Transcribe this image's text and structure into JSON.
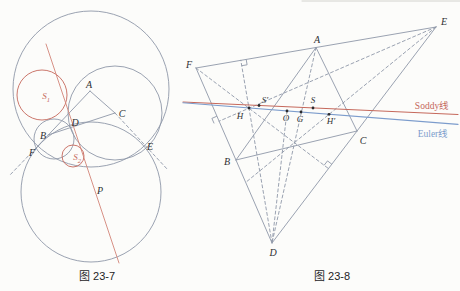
{
  "page": {
    "background": "#fcfcfa"
  },
  "colors": {
    "geometry": "#8f97a8",
    "soddy_red": "#c5685b",
    "soddy_red_light": "#d28478",
    "euler_blue": "#7c9ccc",
    "label": "#2f3033",
    "caption": "#1d1d1f",
    "edge": "#cfcfca"
  },
  "figures": [
    {
      "name": "figure-23-7",
      "caption": {
        "name": "caption-fig-23-7",
        "text": "图 23-7",
        "x": 97,
        "y": 280
      },
      "circles": [
        {
          "name": "outer-circle-top",
          "cx": 91,
          "cy": 89,
          "r": 78,
          "color": "geometry"
        },
        {
          "name": "circle-center-c",
          "cx": 115,
          "cy": 113,
          "r": 47,
          "color": "geometry"
        },
        {
          "name": "circle-center-b",
          "cx": 54,
          "cy": 139,
          "r": 20,
          "color": "geometry"
        },
        {
          "name": "outer-circle-bottom",
          "cx": 91,
          "cy": 192,
          "r": 70,
          "color": "geometry"
        },
        {
          "name": "soddy-circle-s1",
          "cx": 42,
          "cy": 95,
          "r": 25,
          "color": "soddy_red"
        },
        {
          "name": "soddy-circle-s2",
          "cx": 73,
          "cy": 156,
          "r": 11,
          "color": "soddy_red"
        }
      ],
      "lines": [
        {
          "name": "side-a-b-f",
          "x1": 90,
          "y1": 91,
          "x2": 36,
          "y2": 148
        },
        {
          "name": "ext-beyond-f",
          "x1": 36,
          "y1": 148,
          "x2": 9,
          "y2": 176,
          "dash": true
        },
        {
          "name": "side-a-c",
          "x1": 90,
          "y1": 91,
          "x2": 115,
          "y2": 113
        },
        {
          "name": "ext-c-through-e",
          "x1": 115,
          "y1": 113,
          "x2": 168,
          "y2": 170,
          "dash": true
        },
        {
          "name": "side-b-c",
          "x1": 48,
          "y1": 135,
          "x2": 115,
          "y2": 113
        },
        {
          "name": "soddy-line-left",
          "x1": 46,
          "y1": 44,
          "x2": 119,
          "y2": 263,
          "color": "soddy_red_light"
        }
      ],
      "marks": [],
      "points": [],
      "labels": [
        {
          "name": "label-a",
          "text": "A",
          "x": 89,
          "y": 88,
          "size": 10
        },
        {
          "name": "label-b",
          "text": "B",
          "x": 43,
          "y": 139,
          "size": 10
        },
        {
          "name": "label-c",
          "text": "C",
          "x": 122,
          "y": 117,
          "size": 10
        },
        {
          "name": "label-d",
          "text": "D",
          "x": 75,
          "y": 126,
          "size": 10
        },
        {
          "name": "label-f",
          "text": "F",
          "x": 32,
          "y": 156,
          "size": 10
        },
        {
          "name": "label-e",
          "text": "E",
          "x": 150,
          "y": 150,
          "size": 10
        },
        {
          "name": "label-p",
          "text": "P",
          "x": 100,
          "y": 194,
          "size": 10
        },
        {
          "name": "label-s1",
          "text": "S",
          "sub": "1",
          "x": 46,
          "y": 99,
          "size": 9,
          "color": "soddy_red"
        },
        {
          "name": "label-s2",
          "text": "S",
          "sub": "2",
          "x": 77,
          "y": 160,
          "size": 9,
          "color": "soddy_red"
        }
      ]
    },
    {
      "name": "figure-23-8",
      "caption": {
        "name": "caption-fig-23-8",
        "text": "图 23-8",
        "x": 332,
        "y": 280
      },
      "circles": [],
      "lines": [
        {
          "name": "page-edge-artifact",
          "x1": 302,
          "y1": 1,
          "x2": 460,
          "y2": 1,
          "color": "edge"
        },
        {
          "name": "side-f-e",
          "x1": 196,
          "y1": 68,
          "x2": 436,
          "y2": 27
        },
        {
          "name": "side-e-d",
          "x1": 436,
          "y1": 27,
          "x2": 272,
          "y2": 243
        },
        {
          "name": "side-f-d",
          "x1": 196,
          "y1": 68,
          "x2": 272,
          "y2": 243
        },
        {
          "name": "side-a-b",
          "x1": 316,
          "y1": 47.5,
          "x2": 236,
          "y2": 160
        },
        {
          "name": "side-a-c",
          "x1": 316,
          "y1": 47.5,
          "x2": 357,
          "y2": 131
        },
        {
          "name": "side-b-c",
          "x1": 236,
          "y1": 160,
          "x2": 357,
          "y2": 131
        },
        {
          "name": "altitude-from-d",
          "x1": 272,
          "y1": 243,
          "x2": 240.8,
          "y2": 60.3,
          "dash": true
        },
        {
          "name": "altitude-from-e",
          "x1": 436,
          "y1": 27,
          "x2": 219.1,
          "y2": 121.2,
          "dash": true
        },
        {
          "name": "altitude-from-f",
          "x1": 196,
          "y1": 68,
          "x2": 328.5,
          "y2": 168.6,
          "dash": true
        },
        {
          "name": "line-e-hprime",
          "x1": 436,
          "y1": 27,
          "x2": 245.7,
          "y2": 182.4,
          "dash": true
        },
        {
          "name": "line-a-d",
          "x1": 316,
          "y1": 47.5,
          "x2": 272,
          "y2": 243,
          "dash": true
        },
        {
          "name": "line-o-d",
          "x1": 287,
          "y1": 111,
          "x2": 272,
          "y2": 243,
          "dash": true
        },
        {
          "name": "soddy-line",
          "x1": 183,
          "y1": 102,
          "x2": 458,
          "y2": 114.5,
          "color": "soddy_red",
          "w": 1.1
        },
        {
          "name": "euler-line",
          "x1": 183,
          "y1": 102.8,
          "x2": 458,
          "y2": 124.4,
          "color": "euler_blue",
          "w": 1.1
        }
      ],
      "marks": [
        {
          "name": "right-angle-mark-fe",
          "d": "M246.2 59.4 L247.1 64.8 L241.7 65.7"
        },
        {
          "name": "right-angle-mark-fd",
          "d": "M216.9 116.2 L211.9 118.4 L214.1 123.4"
        },
        {
          "name": "right-angle-mark-ed",
          "d": "M331.8 164.2 L327.5 160.9 L324.1 165.3"
        }
      ],
      "points": [
        {
          "name": "point-h",
          "x": 249,
          "y": 108
        },
        {
          "name": "point-s-prime",
          "x": 259,
          "y": 105.5
        },
        {
          "name": "point-o",
          "x": 287,
          "y": 111
        },
        {
          "name": "point-g",
          "x": 301,
          "y": 112
        },
        {
          "name": "point-s",
          "x": 313,
          "y": 108
        },
        {
          "name": "point-h-prime",
          "x": 329,
          "y": 114.3
        }
      ],
      "labels": [
        {
          "name": "label-f",
          "text": "F",
          "x": 189,
          "y": 68,
          "size": 10
        },
        {
          "name": "label-a",
          "text": "A",
          "x": 317,
          "y": 43,
          "size": 10
        },
        {
          "name": "label-e",
          "text": "E",
          "x": 444,
          "y": 25,
          "size": 10
        },
        {
          "name": "label-b",
          "text": "B",
          "x": 227,
          "y": 165,
          "size": 10
        },
        {
          "name": "label-c",
          "text": "C",
          "x": 363,
          "y": 144,
          "size": 10
        },
        {
          "name": "label-d",
          "text": "D",
          "x": 273,
          "y": 256,
          "size": 10
        },
        {
          "name": "label-h",
          "text": "H",
          "x": 240,
          "y": 119,
          "size": 9
        },
        {
          "name": "label-s-prime",
          "text": "S′",
          "x": 265,
          "y": 103,
          "size": 9
        },
        {
          "name": "label-o",
          "text": "O",
          "x": 286,
          "y": 121,
          "size": 9
        },
        {
          "name": "label-g",
          "text": "G",
          "x": 300,
          "y": 122,
          "size": 9
        },
        {
          "name": "label-s",
          "text": "S",
          "x": 313,
          "y": 103,
          "size": 9
        },
        {
          "name": "label-h-prime",
          "text": "H′",
          "x": 331,
          "y": 124,
          "size": 9
        },
        {
          "name": "soddy-line-label",
          "text": "Soddy线",
          "x": 432,
          "y": 109,
          "size": 9.5,
          "color": "soddy_red",
          "italic": false
        },
        {
          "name": "euler-line-label",
          "text": "Euler线",
          "x": 433,
          "y": 137,
          "size": 9.5,
          "color": "euler_blue",
          "italic": false
        }
      ]
    }
  ]
}
